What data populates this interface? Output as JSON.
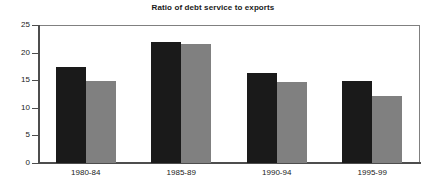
{
  "chart_data": {
    "type": "bar",
    "title": "Ratio of debt service to exports",
    "xlabel": "",
    "ylabel": "",
    "categories": [
      "1980-84",
      "1985-89",
      "1990-94",
      "1995-99"
    ],
    "series": [
      {
        "name": "series-1",
        "color": "#1a1a1a",
        "values": [
          17.4,
          22.0,
          16.3,
          14.8
        ]
      },
      {
        "name": "series-2",
        "color": "#808080",
        "values": [
          14.8,
          21.6,
          14.7,
          12.1
        ]
      }
    ],
    "ylim": [
      0,
      25
    ],
    "yticks": [
      0,
      5,
      10,
      15,
      20,
      25
    ],
    "ytick_labels": [
      "0",
      "5",
      "10",
      "15",
      "20",
      "25"
    ],
    "grid": false,
    "legend": "none",
    "frame": true
  },
  "colors": {
    "background": "#ffffff",
    "axis": "#4d4d4d",
    "frame": "#808080",
    "text": "#1a1a1a",
    "series_dark": "#1a1a1a",
    "series_gray": "#808080"
  }
}
